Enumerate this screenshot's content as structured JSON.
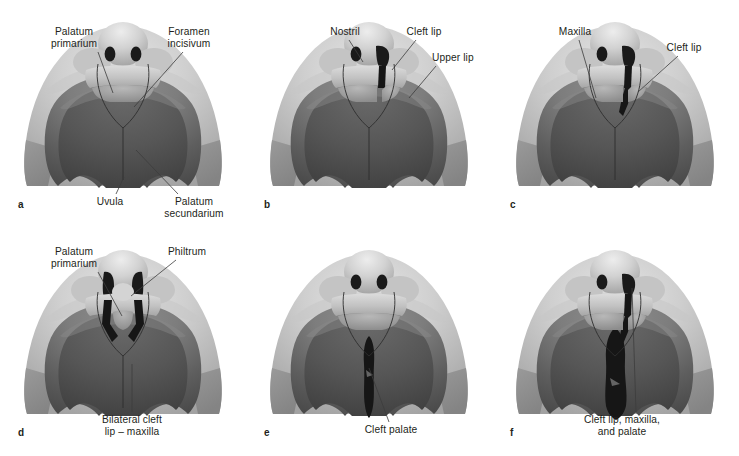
{
  "figure": {
    "background_color": "#ffffff",
    "text_color": "#231f20",
    "leader_color": "#3c3c3c",
    "palette": {
      "skin_light": "#cfcfcf",
      "skin_mid": "#b3b3b3",
      "cheek_wedge": "#8c8c8c",
      "palate_mid": "#7d7d7d",
      "palate_dark": "#5e5e5e",
      "oral_dark": "#4a4a4a",
      "cleft_black": "#161616",
      "nostril_black": "#1a1a1a",
      "highlight": "#e6e6e6"
    },
    "panels": [
      {
        "id": "a",
        "letter": "a",
        "caption": "Normal palate",
        "cleft_type": "none",
        "labels": [
          {
            "name": "palatum-primarium",
            "text": "Palatum\nprimarium",
            "align": "ctr",
            "x": 36,
            "y": 26,
            "w": 76,
            "lx": 98,
            "ly": 52,
            "tx": 113,
            "ty": 93
          },
          {
            "name": "foramen-incisivum",
            "text": "Foramen\nincisivum",
            "align": "ctr",
            "x": 150,
            "y": 26,
            "w": 78,
            "lx": 183,
            "ly": 52,
            "tx": 134,
            "ty": 107
          },
          {
            "name": "uvula",
            "text": "Uvula",
            "align": "ctr",
            "x": 88,
            "y": 196,
            "w": 44,
            "lx": 116,
            "ly": 194,
            "tx": 124,
            "ty": 177
          },
          {
            "name": "palatum-secundarium",
            "text": "Palatum\nsecundarium",
            "align": "ctr",
            "x": 150,
            "y": 196,
            "w": 88,
            "lx": 178,
            "ly": 194,
            "tx": 136,
            "ty": 150
          }
        ]
      },
      {
        "id": "b",
        "letter": "b",
        "caption": "Unilateral cleft lip",
        "cleft_type": "unilateral-lip",
        "labels": [
          {
            "name": "nostril",
            "text": "Nostril",
            "align": "ctr",
            "x": 76,
            "y": 26,
            "w": 46,
            "lx": 103,
            "ly": 40,
            "tx": 117,
            "ty": 62
          },
          {
            "name": "cleft-lip",
            "text": "Cleft lip",
            "align": "ctr",
            "x": 152,
            "y": 26,
            "w": 52,
            "lx": 170,
            "ly": 40,
            "tx": 146,
            "ty": 70
          },
          {
            "name": "upper-lip",
            "text": "Upper lip",
            "align": "left",
            "x": 186,
            "y": 52,
            "w": 58,
            "lx": 190,
            "ly": 66,
            "tx": 163,
            "ty": 98
          }
        ]
      },
      {
        "id": "c",
        "letter": "c",
        "caption": "Unilateral cleft lip with maxilla",
        "cleft_type": "unilateral-lip-maxilla",
        "labels": [
          {
            "name": "maxilla",
            "text": "Maxilla",
            "align": "ctr",
            "x": 58,
            "y": 26,
            "w": 50,
            "lx": 87,
            "ly": 40,
            "tx": 104,
            "ty": 98
          },
          {
            "name": "cleft-lip",
            "text": "Cleft lip",
            "align": "ctr",
            "x": 166,
            "y": 42,
            "w": 52,
            "lx": 186,
            "ly": 56,
            "tx": 146,
            "ty": 92
          }
        ]
      },
      {
        "id": "d",
        "letter": "d",
        "caption": "Bilateral cleft lip and maxilla",
        "cleft_type": "bilateral-lip-maxilla",
        "labels": [
          {
            "name": "palatum-primarium",
            "text": "Palatum\nprimarium",
            "align": "ctr",
            "x": 36,
            "y": 18,
            "w": 76,
            "lx": 98,
            "ly": 44,
            "tx": 122,
            "ty": 88
          },
          {
            "name": "philtrum",
            "text": "Philtrum",
            "align": "ctr",
            "x": 160,
            "y": 18,
            "w": 54,
            "lx": 176,
            "ly": 32,
            "tx": 131,
            "ty": 68
          },
          {
            "name": "bilateral-cleft-lip-maxilla",
            "text": "Bilateral cleft\nlip – maxilla",
            "align": "ctr",
            "x": 84,
            "y": 186,
            "w": 96,
            "lx": 132,
            "ly": 184,
            "tx": 132,
            "ty": 136
          }
        ]
      },
      {
        "id": "e",
        "letter": "e",
        "caption": "Cleft palate",
        "cleft_type": "palate",
        "labels": [
          {
            "name": "cleft-palate",
            "text": "Cleft palate",
            "align": "ctr",
            "x": 108,
            "y": 196,
            "w": 74,
            "lx": 143,
            "ly": 194,
            "tx": 123,
            "ty": 140
          }
        ]
      },
      {
        "id": "f",
        "letter": "f",
        "caption": "Cleft lip, maxilla, and palate",
        "cleft_type": "complete",
        "labels": [
          {
            "name": "cleft-lip-maxilla-and-palate",
            "text": "Cleft lip, maxilla,\nand palate",
            "align": "ctr",
            "x": 74,
            "y": 186,
            "w": 112,
            "lx": 144,
            "ly": 184,
            "tx": 140,
            "ty": 60
          }
        ]
      }
    ]
  }
}
